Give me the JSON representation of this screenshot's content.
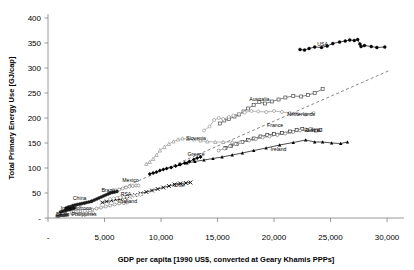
{
  "chart_data": {
    "type": "scatter",
    "title": "",
    "xlabel": "GDP per capita [1990 US$, converted at Geary Khamis PPPs]",
    "ylabel": "Total Primary Energy Use [GJ/cap]",
    "xlim": [
      0,
      31500
    ],
    "ylim": [
      0,
      400
    ],
    "xticks": [
      0,
      5000,
      10000,
      15000,
      20000,
      25000,
      30000
    ],
    "xtick_labels": [
      "-",
      "5,000",
      "10,000",
      "15,000",
      "20,000",
      "25,000",
      "30,000"
    ],
    "yticks": [
      0,
      50,
      100,
      150,
      200,
      250,
      300,
      350,
      400
    ],
    "ytick_labels": [
      "-",
      "50",
      "100",
      "150",
      "200",
      "250",
      "300",
      "350",
      "400"
    ],
    "grid": false,
    "legend": "none (inline series labels)",
    "annotations": [
      {
        "text": "USA",
        "x": 24300,
        "y": 345
      },
      {
        "text": "Australia",
        "x": 18700,
        "y": 234
      },
      {
        "text": "Netherlands",
        "x": 22400,
        "y": 205
      },
      {
        "text": "Austria",
        "x": 23400,
        "y": 172
      },
      {
        "text": "France",
        "x": 20100,
        "y": 183
      },
      {
        "text": "Ireland",
        "x": 20400,
        "y": 135
      },
      {
        "text": "Slovenia",
        "x": 13100,
        "y": 156
      },
      {
        "text": "Greece",
        "x": 13100,
        "y": 125
      },
      {
        "text": "Chile",
        "x": 11600,
        "y": 62
      },
      {
        "text": "Mexico",
        "x": 7300,
        "y": 72
      },
      {
        "text": "Brazil",
        "x": 5300,
        "y": 52
      },
      {
        "text": "RSA",
        "x": 6900,
        "y": 45
      },
      {
        "text": "Thailand",
        "x": 7000,
        "y": 30
      },
      {
        "text": "China",
        "x": 2800,
        "y": 36
      },
      {
        "text": "Morroco",
        "x": 3000,
        "y": 17
      },
      {
        "text": "India",
        "x": 1600,
        "y": 17
      },
      {
        "text": "Benin",
        "x": 1300,
        "y": 5
      },
      {
        "text": "Philippines",
        "x": 3200,
        "y": 5
      }
    ],
    "trend_line": {
      "style": "dashed",
      "x": [
        1000,
        30200
      ],
      "y": [
        5,
        295
      ]
    },
    "series": [
      {
        "name": "USA",
        "marker": "filled-circle",
        "color": "#000000",
        "points": [
          [
            22300,
            337
          ],
          [
            22700,
            336
          ],
          [
            23100,
            339
          ],
          [
            23600,
            342
          ],
          [
            24200,
            341
          ],
          [
            24700,
            344
          ],
          [
            25200,
            349
          ],
          [
            25800,
            352
          ],
          [
            26300,
            354
          ],
          [
            26700,
            356
          ],
          [
            27100,
            355
          ],
          [
            27400,
            357
          ],
          [
            27600,
            348
          ],
          [
            27700,
            343
          ],
          [
            28000,
            345
          ],
          [
            28600,
            343
          ],
          [
            29100,
            341
          ],
          [
            29800,
            342
          ]
        ]
      },
      {
        "name": "Australia",
        "marker": "open-square",
        "color": "#4d4d4d",
        "points": [
          [
            15200,
            189
          ],
          [
            15600,
            195
          ],
          [
            16000,
            198
          ],
          [
            16500,
            203
          ],
          [
            16900,
            207
          ],
          [
            17300,
            213
          ],
          [
            17700,
            219
          ],
          [
            18200,
            226
          ],
          [
            18700,
            232
          ],
          [
            19200,
            229
          ],
          [
            19800,
            233
          ],
          [
            20400,
            237
          ],
          [
            21000,
            241
          ],
          [
            21700,
            244
          ],
          [
            22400,
            243
          ],
          [
            23000,
            246
          ],
          [
            23600,
            250
          ],
          [
            24300,
            258
          ]
        ]
      },
      {
        "name": "Netherlands",
        "marker": "open-circle",
        "color": "#999999",
        "points": [
          [
            13800,
            175
          ],
          [
            14300,
            183
          ],
          [
            14700,
            196
          ],
          [
            15100,
            200
          ],
          [
            15500,
            198
          ],
          [
            16000,
            202
          ],
          [
            16400,
            205
          ],
          [
            16900,
            208
          ],
          [
            17400,
            211
          ],
          [
            18000,
            214
          ],
          [
            18600,
            213
          ],
          [
            19300,
            212
          ],
          [
            20000,
            214
          ],
          [
            20700,
            212
          ],
          [
            21400,
            210
          ],
          [
            22100,
            208
          ],
          [
            22800,
            207
          ],
          [
            23500,
            210
          ]
        ]
      },
      {
        "name": "Austria",
        "marker": "open-square",
        "color": "#333333",
        "points": [
          [
            15700,
            140
          ],
          [
            16200,
            144
          ],
          [
            16700,
            148
          ],
          [
            17200,
            152
          ],
          [
            17700,
            156
          ],
          [
            18200,
            159
          ],
          [
            18800,
            163
          ],
          [
            19400,
            166
          ],
          [
            20000,
            168
          ],
          [
            20700,
            170
          ],
          [
            21400,
            173
          ],
          [
            22000,
            176
          ],
          [
            22500,
            178
          ],
          [
            22900,
            176
          ],
          [
            23300,
            177
          ],
          [
            23700,
            175
          ],
          [
            24100,
            176
          ]
        ]
      },
      {
        "name": "France",
        "marker": "open-circle",
        "color": "#808080",
        "points": [
          [
            15100,
            135
          ],
          [
            15600,
            139
          ],
          [
            16100,
            144
          ],
          [
            16600,
            148
          ],
          [
            17200,
            152
          ],
          [
            17800,
            155
          ],
          [
            18400,
            158
          ],
          [
            19000,
            161
          ],
          [
            19600,
            163
          ],
          [
            20300,
            166
          ],
          [
            21000,
            169
          ],
          [
            21700,
            172
          ],
          [
            22300,
            175
          ],
          [
            22800,
            177
          ],
          [
            23200,
            178
          ]
        ]
      },
      {
        "name": "Ireland",
        "marker": "filled-triangle",
        "color": "#000000",
        "points": [
          [
            11600,
            107
          ],
          [
            12300,
            110
          ],
          [
            13000,
            113
          ],
          [
            13800,
            116
          ],
          [
            14600,
            119
          ],
          [
            15400,
            122
          ],
          [
            16300,
            126
          ],
          [
            17200,
            130
          ],
          [
            18200,
            135
          ],
          [
            19300,
            140
          ],
          [
            20500,
            146
          ],
          [
            21700,
            151
          ],
          [
            22800,
            156
          ],
          [
            23600,
            152
          ],
          [
            24300,
            152
          ],
          [
            25100,
            150
          ],
          [
            25900,
            149
          ],
          [
            26500,
            152
          ]
        ]
      },
      {
        "name": "Slovenia",
        "marker": "open-triangle",
        "color": "#999999",
        "points": [
          [
            8700,
            108
          ],
          [
            9000,
            112
          ],
          [
            9300,
            118
          ],
          [
            9600,
            126
          ],
          [
            9900,
            135
          ],
          [
            10300,
            142
          ],
          [
            10700,
            148
          ],
          [
            11100,
            153
          ],
          [
            11500,
            157
          ],
          [
            11900,
            159
          ],
          [
            12400,
            158
          ],
          [
            12900,
            157
          ],
          [
            13500,
            155
          ],
          [
            14100,
            153
          ],
          [
            14800,
            152
          ],
          [
            15500,
            152
          ],
          [
            16300,
            152
          ],
          [
            17000,
            152
          ]
        ]
      },
      {
        "name": "Greece",
        "marker": "filled-diamond",
        "color": "#000000",
        "points": [
          [
            9000,
            88
          ],
          [
            9300,
            90
          ],
          [
            9600,
            92
          ],
          [
            9900,
            95
          ],
          [
            10200,
            97
          ],
          [
            10500,
            99
          ],
          [
            10900,
            101
          ],
          [
            11300,
            104
          ],
          [
            11700,
            107
          ],
          [
            12100,
            110
          ],
          [
            12500,
            113
          ],
          [
            12900,
            117
          ],
          [
            13200,
            120
          ],
          [
            13500,
            122
          ]
        ]
      },
      {
        "name": "Chile",
        "marker": "cross-x",
        "color": "#000000",
        "points": [
          [
            4800,
            31
          ],
          [
            5200,
            33
          ],
          [
            5600,
            35
          ],
          [
            6000,
            37
          ],
          [
            6400,
            39
          ],
          [
            6800,
            41
          ],
          [
            7200,
            43
          ],
          [
            7700,
            46
          ],
          [
            8200,
            49
          ],
          [
            8700,
            52
          ],
          [
            9200,
            55
          ],
          [
            9700,
            58
          ],
          [
            10200,
            61
          ],
          [
            10700,
            64
          ],
          [
            11200,
            67
          ],
          [
            11700,
            69
          ],
          [
            12200,
            70
          ],
          [
            12600,
            71
          ]
        ]
      },
      {
        "name": "Mexico",
        "marker": "open-circle",
        "color": "#808080",
        "points": [
          [
            5400,
            49
          ],
          [
            5700,
            52
          ],
          [
            6000,
            55
          ],
          [
            6300,
            57
          ],
          [
            6600,
            59
          ],
          [
            6900,
            61
          ],
          [
            7200,
            63
          ],
          [
            7500,
            64
          ],
          [
            7800,
            65
          ],
          [
            8000,
            65
          ]
        ]
      },
      {
        "name": "Brazil",
        "marker": "filled-circle",
        "color": "#1a1a1a",
        "points": [
          [
            3900,
            34
          ],
          [
            4100,
            36
          ],
          [
            4300,
            38
          ],
          [
            4500,
            40
          ],
          [
            4700,
            42
          ],
          [
            4900,
            44
          ],
          [
            5100,
            46
          ],
          [
            5300,
            48
          ],
          [
            5500,
            50
          ],
          [
            5700,
            51
          ],
          [
            5900,
            52
          ],
          [
            6100,
            53
          ]
        ]
      },
      {
        "name": "RSA",
        "marker": "open-diamond",
        "color": "#999999",
        "points": [
          [
            5500,
            38
          ],
          [
            5800,
            39
          ],
          [
            6100,
            40
          ],
          [
            6400,
            41
          ],
          [
            6700,
            42
          ],
          [
            7000,
            43
          ],
          [
            7300,
            44
          ],
          [
            7600,
            45
          ],
          [
            7900,
            46
          ],
          [
            8200,
            47
          ]
        ]
      },
      {
        "name": "Thailand",
        "marker": "open-circle",
        "color": "#808080",
        "points": [
          [
            3500,
            15
          ],
          [
            3900,
            17
          ],
          [
            4300,
            19
          ],
          [
            4700,
            21
          ],
          [
            5100,
            23
          ],
          [
            5500,
            25
          ],
          [
            5900,
            27
          ],
          [
            6300,
            29
          ],
          [
            6700,
            30
          ],
          [
            7000,
            31
          ]
        ]
      },
      {
        "name": "China",
        "marker": "filled-circle",
        "color": "#1a1a1a",
        "points": [
          [
            1600,
            20
          ],
          [
            1800,
            22
          ],
          [
            2000,
            23
          ],
          [
            2200,
            25
          ],
          [
            2400,
            26
          ],
          [
            2600,
            27
          ],
          [
            2800,
            28
          ],
          [
            3000,
            29
          ],
          [
            3200,
            30
          ],
          [
            3400,
            31
          ],
          [
            3600,
            32
          ],
          [
            3800,
            33
          ]
        ]
      },
      {
        "name": "Morroco",
        "marker": "open-square",
        "color": "#999999",
        "points": [
          [
            2100,
            11
          ],
          [
            2300,
            12
          ],
          [
            2500,
            12
          ],
          [
            2700,
            13
          ],
          [
            2900,
            13
          ],
          [
            3100,
            14
          ],
          [
            3300,
            14
          ],
          [
            3500,
            15
          ],
          [
            3700,
            15
          ]
        ]
      },
      {
        "name": "India",
        "marker": "filled-circle",
        "color": "#1a1a1a",
        "points": [
          [
            1100,
            12
          ],
          [
            1250,
            13
          ],
          [
            1400,
            14
          ],
          [
            1550,
            15
          ],
          [
            1700,
            16
          ],
          [
            1850,
            17
          ],
          [
            2000,
            18
          ],
          [
            2150,
            19
          ],
          [
            2300,
            20
          ]
        ]
      },
      {
        "name": "Philippines",
        "marker": "open-circle",
        "color": "#999999",
        "points": [
          [
            2200,
            8
          ],
          [
            2500,
            8
          ],
          [
            2800,
            9
          ],
          [
            3100,
            9
          ],
          [
            3400,
            9
          ],
          [
            3700,
            10
          ],
          [
            4000,
            10
          ]
        ]
      },
      {
        "name": "Benin",
        "marker": "filled-square",
        "color": "#4d4d4d",
        "points": [
          [
            800,
            4
          ],
          [
            950,
            4
          ],
          [
            1100,
            5
          ],
          [
            1250,
            5
          ],
          [
            1400,
            5
          ],
          [
            1550,
            6
          ],
          [
            1700,
            6
          ]
        ]
      }
    ]
  }
}
